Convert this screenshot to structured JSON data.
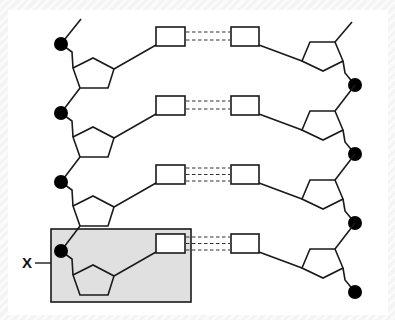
{
  "figure": {
    "type": "DNA double helix segment schematic",
    "background_color": "#ffffff",
    "highlight_color": "#e0e0e0",
    "stroke_color": "#1a1a1a",
    "phosphate_color": "#000000"
  },
  "label": {
    "text": "X",
    "points_to": "highlighted nucleotide (phosphate + sugar + base)"
  },
  "base_pairs": [
    {
      "index": 1,
      "hydrogen_bonds": 2
    },
    {
      "index": 2,
      "hydrogen_bonds": 2
    },
    {
      "index": 3,
      "hydrogen_bonds": 3
    },
    {
      "index": 4,
      "hydrogen_bonds": 3
    }
  ],
  "components": {
    "phosphate": {
      "shape": "filled circle",
      "icon": "phosphate-circle-icon"
    },
    "sugar": {
      "shape": "pentagon",
      "icon": "deoxyribose-pentagon-icon"
    },
    "base": {
      "shape": "rectangle",
      "icon": "nitrogenous-base-rect-icon"
    },
    "hydrogen_bond": {
      "shape": "dashed line",
      "icon": "hydrogen-bond-dash-icon"
    }
  },
  "highlight_box": {
    "label_ref": "X",
    "row": 4,
    "strand": "left"
  }
}
